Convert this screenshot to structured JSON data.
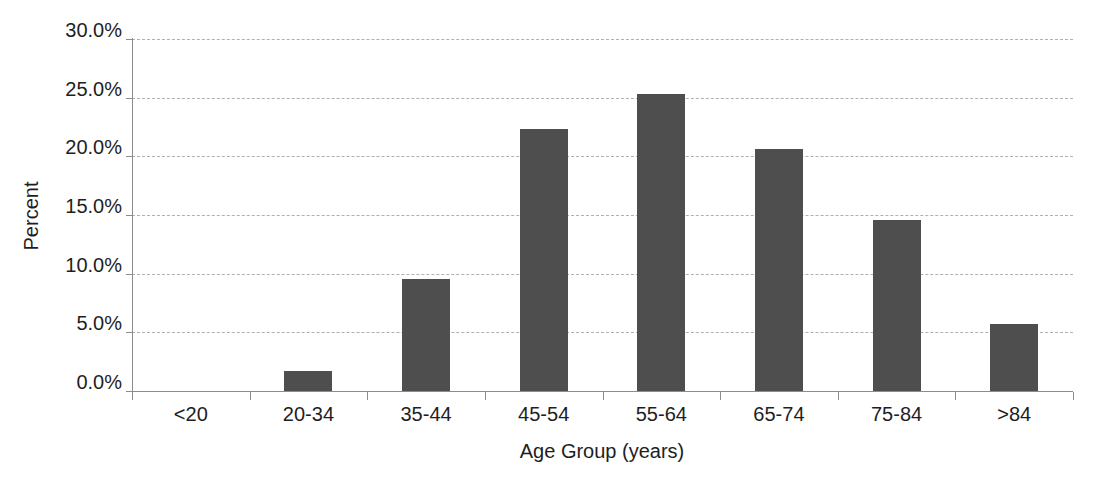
{
  "chart_data": {
    "type": "bar",
    "title": "",
    "xlabel": "Age Group (years)",
    "ylabel": "Percent",
    "categories": [
      "<20",
      "20-34",
      "35-44",
      "45-54",
      "55-64",
      "65-74",
      "75-84",
      ">84"
    ],
    "values": [
      0.0,
      1.8,
      9.6,
      22.4,
      25.4,
      20.7,
      14.7,
      5.8
    ],
    "ylim": [
      0,
      30
    ],
    "ytick_step": 5,
    "ytick_labels": [
      "0.0%",
      "5.0%",
      "10.0%",
      "15.0%",
      "20.0%",
      "25.0%",
      "30.0%"
    ],
    "grid": true,
    "legend": "none",
    "bar_width_px": 48,
    "colors": {
      "bar": "#4e4e4e",
      "gridline": "#b0b0b0",
      "axis": "#8c8c8c",
      "text": "#1e1e1e",
      "background": "#ffffff"
    }
  }
}
